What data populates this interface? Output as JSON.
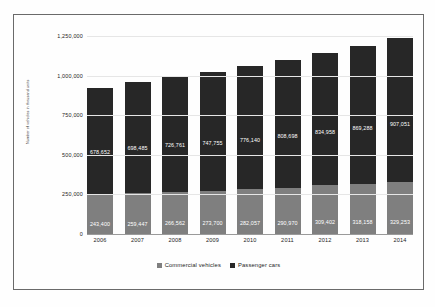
{
  "chart_data": {
    "type": "bar",
    "stacked": true,
    "title": "",
    "subtitle": "",
    "xlabel": "",
    "ylabel": "Number of vehicles in thousand units",
    "categories": [
      "2006",
      "2007",
      "2008",
      "2009",
      "2010",
      "2011",
      "2012",
      "2013",
      "2014"
    ],
    "series": [
      {
        "name": "Commercial vehicles",
        "color": "#7f7f7f",
        "values": [
          243400,
          259447,
          266562,
          273700,
          282057,
          290970,
          309402,
          318158,
          329253
        ],
        "labels": [
          "243,400",
          "259,447",
          "266,562",
          "273,700",
          "282,057",
          "290,970",
          "309,402",
          "318,158",
          "329,253"
        ]
      },
      {
        "name": "Passenger cars",
        "color": "#272727",
        "values": [
          678652,
          698485,
          726761,
          747755,
          776140,
          808698,
          834958,
          869288,
          907051
        ],
        "labels": [
          "678,652",
          "698,485",
          "726,761",
          "747,755",
          "776,140",
          "808,698",
          "834,958",
          "869,288",
          "907,051"
        ]
      }
    ],
    "totals": [
      922052,
      957932,
      993323,
      1021455,
      1058197,
      1099668,
      1144360,
      1187446,
      1236304
    ],
    "ylim": [
      0,
      1250000
    ],
    "yticks": [
      0,
      250000,
      500000,
      750000,
      1000000,
      1250000
    ],
    "ytick_labels": [
      "0",
      "250,000",
      "500,000",
      "750,000",
      "1,000,000",
      "1,250,000"
    ],
    "grid": true,
    "legend_position": "bottom",
    "legend": [
      {
        "label": "Commercial vehicles",
        "color": "#7f7f7f"
      },
      {
        "label": "Passenger cars",
        "color": "#272727"
      }
    ]
  },
  "caption": ""
}
